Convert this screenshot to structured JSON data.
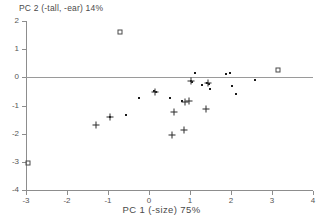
{
  "chart_data": {
    "type": "scatter",
    "title": "",
    "xlabel": "PC 1 (-size) 75%",
    "ylabel": "PC 2 (-tall, -ear) 14%",
    "xlim": [
      -3,
      4
    ],
    "ylim": [
      -4,
      2
    ],
    "xticks": [
      -3,
      -2,
      -1,
      0,
      1,
      2,
      3,
      4
    ],
    "yticks": [
      2,
      1,
      0,
      -1,
      -2,
      -3,
      -4
    ],
    "xtick_labels": [
      "-3",
      "-2",
      "-1",
      "0",
      "1",
      "2",
      "3",
      "4"
    ],
    "ytick_labels": [
      "2",
      "1",
      "0",
      "-1",
      "-2",
      "-3",
      "-4"
    ],
    "grid": false,
    "legend": "none",
    "reference_lines": [
      {
        "axis": "horizontal",
        "value": 0
      }
    ],
    "series": [
      {
        "name": "dot",
        "marker": "dot",
        "points": [
          [
            -0.95,
            -1.4
          ],
          [
            -0.55,
            -1.35
          ],
          [
            -0.25,
            -0.75
          ],
          [
            0.12,
            -0.5
          ],
          [
            0.18,
            -0.52
          ],
          [
            0.52,
            -0.73
          ],
          [
            0.8,
            -0.85
          ],
          [
            1.02,
            -0.13
          ],
          [
            1.05,
            -0.15
          ],
          [
            1.13,
            0.15
          ],
          [
            1.3,
            -0.28
          ],
          [
            1.42,
            -0.2
          ],
          [
            1.47,
            -0.22
          ],
          [
            1.48,
            -0.4
          ],
          [
            1.88,
            0.13
          ],
          [
            1.97,
            0.14
          ],
          [
            2.02,
            -0.32
          ],
          [
            2.13,
            -0.58
          ],
          [
            2.58,
            -0.09
          ]
        ]
      },
      {
        "name": "plus",
        "marker": "plus",
        "points": [
          [
            -1.3,
            -1.7
          ],
          [
            -0.95,
            -1.4
          ],
          [
            0.15,
            -0.51
          ],
          [
            0.55,
            -2.05
          ],
          [
            0.62,
            -1.22
          ],
          [
            0.85,
            -1.88
          ],
          [
            0.88,
            -0.86
          ],
          [
            0.98,
            -0.85
          ],
          [
            1.03,
            -0.14
          ],
          [
            1.38,
            -1.13
          ],
          [
            1.45,
            -0.21
          ]
        ]
      },
      {
        "name": "square",
        "marker": "square",
        "points": [
          [
            -0.7,
            1.6
          ],
          [
            -2.95,
            -3.05
          ],
          [
            3.15,
            0.27
          ]
        ]
      }
    ]
  }
}
